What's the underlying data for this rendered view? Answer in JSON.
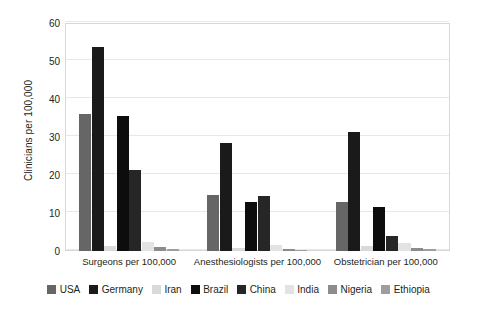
{
  "chart_data": {
    "type": "bar",
    "title": "",
    "subtitle": "",
    "xlabel": "",
    "ylabel": "Clinicians per 100,000",
    "ylim": [
      0,
      60
    ],
    "yticks": [
      0,
      10,
      20,
      30,
      40,
      50,
      60
    ],
    "ytick_labels": [
      "0",
      "10",
      "20",
      "30",
      "40",
      "50",
      "60"
    ],
    "grid": true,
    "legend_position": "bottom",
    "categories": [
      "Surgeons per 100,000",
      "Anesthesiologists per 100,000",
      "Obstetrician per 100,000"
    ],
    "series": [
      {
        "name": "USA",
        "color": "#666666",
        "values": [
          36.0,
          14.8,
          12.9
        ]
      },
      {
        "name": "Germany",
        "color": "#1a1a1a",
        "values": [
          53.7,
          28.5,
          31.4
        ]
      },
      {
        "name": "Iran",
        "color": "#d9d9d9",
        "values": [
          1.4,
          0.9,
          1.3
        ]
      },
      {
        "name": "Brazil",
        "color": "#0d0d0d",
        "values": [
          35.4,
          13.0,
          11.5
        ]
      },
      {
        "name": "China",
        "color": "#262626",
        "values": [
          21.2,
          14.4,
          4.0
        ]
      },
      {
        "name": "India",
        "color": "#e3e3e3",
        "values": [
          2.5,
          1.7,
          2.2
        ]
      },
      {
        "name": "Nigeria",
        "color": "#8c8c8c",
        "values": [
          1.0,
          0.6,
          0.9
        ]
      },
      {
        "name": "Ethiopia",
        "color": "#9e9e9e",
        "values": [
          0.5,
          0.3,
          0.4
        ]
      }
    ]
  },
  "legend": {
    "items": [
      {
        "label": "USA"
      },
      {
        "label": "Germany"
      },
      {
        "label": "Iran"
      },
      {
        "label": "Brazil"
      },
      {
        "label": "China"
      },
      {
        "label": "India"
      },
      {
        "label": "Nigeria"
      },
      {
        "label": "Ethiopia"
      }
    ]
  },
  "axis": {
    "y_title": "Clinicians per 100,000"
  }
}
